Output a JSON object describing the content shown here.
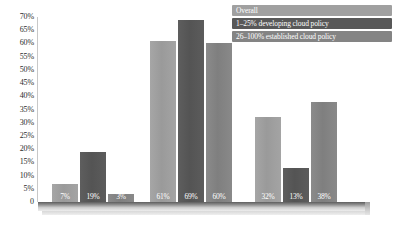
{
  "title_sliver": "",
  "legend": {
    "position": "top-right",
    "entries": [
      {
        "label": "Overall",
        "color": "#a0a0a0"
      },
      {
        "label": "1–25% developing cloud policy",
        "color": "#585858"
      },
      {
        "label": "26–100% established cloud policy",
        "color": "#848484"
      }
    ]
  },
  "axis": {
    "y_ticks": [
      "70%",
      "65%",
      "60%",
      "55%",
      "50%",
      "45%",
      "40%",
      "35%",
      "30%",
      "25%",
      "20%",
      "15%",
      "10%",
      "5%",
      "0"
    ],
    "x_categories": [
      "",
      "",
      ""
    ]
  },
  "chart_data": {
    "type": "bar",
    "title": "",
    "subtitle": "",
    "xlabel": "",
    "ylabel": "",
    "ylim": [
      0,
      70
    ],
    "ytick_step": 5,
    "grid": false,
    "legend_position": "top-right",
    "value_labels": true,
    "value_label_suffix": "%",
    "categories": [
      "Group 1",
      "Group 2",
      "Group 3"
    ],
    "series": [
      {
        "name": "Overall",
        "color": "#a0a0a0",
        "values": [
          7,
          61,
          32
        ],
        "labels": [
          "7%",
          "61%",
          "32%"
        ]
      },
      {
        "name": "1–25% developing cloud policy",
        "color": "#585858",
        "values": [
          19,
          69,
          13
        ],
        "labels": [
          "19%",
          "69%",
          "13%"
        ]
      },
      {
        "name": "26–100% established cloud policy",
        "color": "#848484",
        "values": [
          3,
          60,
          38
        ],
        "labels": [
          "3%",
          "60%",
          "38%"
        ]
      }
    ]
  }
}
